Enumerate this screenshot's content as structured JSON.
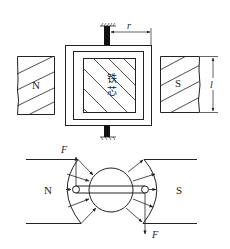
{
  "top_view": {
    "magnet_left_label": "N",
    "magnet_right_label": "S",
    "core_label_line1": "铁",
    "core_label_line2": "芯",
    "radius_label": "r",
    "length_label": "l"
  },
  "bottom_view": {
    "magnet_left_label": "N",
    "magnet_right_label": "S",
    "force_top_label": "F",
    "force_bottom_label": "F"
  },
  "colors": {
    "stroke": "#222222",
    "background": "#ffffff",
    "shaft": "#111111"
  }
}
